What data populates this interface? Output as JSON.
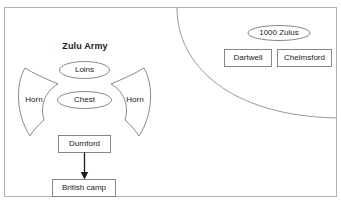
{
  "diagram": {
    "title_label": "Zulu Army",
    "formation": {
      "loins_label": "Loins",
      "chest_label": "Chest",
      "horn_left_label": "Horn",
      "horn_right_label": "Horn"
    },
    "british": {
      "durnford_label": "Durnford",
      "camp_label": "British camp"
    },
    "right_side": {
      "zulus_count_label": "1000 Zulus",
      "dartwell_label": "Dartwell",
      "chelmsford_label": "Chelmsford"
    },
    "colors": {
      "frame_stroke": "#b3b3b3",
      "shape_stroke": "#7a7a7a",
      "arc_stroke": "#8c8c8c",
      "arrow_fill": "#1a1a1a",
      "text": "#1a1a1a",
      "background": "#ffffff"
    }
  }
}
